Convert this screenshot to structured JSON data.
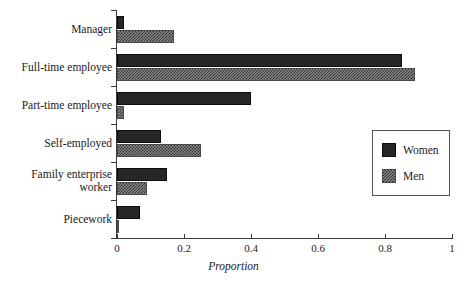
{
  "chart_data": {
    "type": "bar",
    "orientation": "horizontal",
    "title": "",
    "xlabel": "Proportion",
    "ylabel": "",
    "xlim": [
      0,
      1
    ],
    "xticks": [
      "0",
      "0.2",
      "0.4",
      "0.6",
      "0.8",
      "1"
    ],
    "xtick_values": [
      0,
      0.2,
      0.4,
      0.6,
      0.8,
      1
    ],
    "grid": false,
    "legend_position": "right",
    "categories": [
      "Manager",
      "Full-time employee",
      "Part-time employee",
      "Self-employed",
      "Family enterprise worker",
      "Piecework"
    ],
    "series": [
      {
        "name": "Women",
        "color": "#262626",
        "values": [
          0.02,
          0.85,
          0.4,
          0.13,
          0.15,
          0.07
        ]
      },
      {
        "name": "Men",
        "color": "#8a8a8a",
        "values": [
          0.17,
          0.89,
          0.02,
          0.25,
          0.09,
          0.005
        ]
      }
    ]
  },
  "legend": {
    "items": [
      {
        "label": "Women"
      },
      {
        "label": "Men"
      }
    ]
  },
  "axis": {
    "x_title": "Proportion"
  }
}
